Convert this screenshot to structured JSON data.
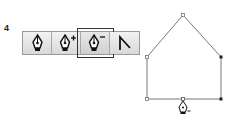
{
  "step_label": "4",
  "toolbar": {
    "buttons": [
      {
        "name": "pen-tool",
        "icon": "pen-nib-icon",
        "selected": false
      },
      {
        "name": "add-anchor-point-tool",
        "icon": "pen-plus-icon",
        "selected": false
      },
      {
        "name": "delete-anchor-point-tool",
        "icon": "pen-minus-icon",
        "selected": true
      },
      {
        "name": "convert-anchor-point-tool",
        "icon": "convert-point-icon",
        "selected": false
      }
    ]
  },
  "shape": {
    "type": "house-path",
    "anchors": [
      {
        "x": 183,
        "y": 15,
        "selected": false
      },
      {
        "x": 221,
        "y": 57,
        "selected": true
      },
      {
        "x": 221,
        "y": 99,
        "selected": true
      },
      {
        "x": 183,
        "y": 99,
        "selected": false
      },
      {
        "x": 147,
        "y": 99,
        "selected": false
      },
      {
        "x": 147,
        "y": 57,
        "selected": false
      }
    ],
    "cursor": "pen-minus-cursor"
  }
}
